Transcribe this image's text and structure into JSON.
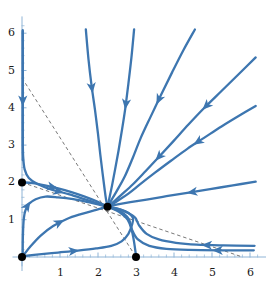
{
  "figure": {
    "kind": "phase-portrait",
    "background_color": "#ffffff",
    "trajectory_color": "#3d76b0",
    "axis_color": "#8fb4d6",
    "nullcline_color": "#555555",
    "equilibrium_color": "#000000"
  },
  "axes": {
    "x_label": "",
    "y_label": "",
    "x_ticks": [
      "1",
      "2",
      "3",
      "4",
      "5",
      "6"
    ],
    "y_ticks": [
      "1",
      "2",
      "3",
      "4",
      "5",
      "6"
    ],
    "x_tick_values": [
      1,
      2,
      3,
      4,
      5,
      6
    ],
    "y_tick_values": [
      1,
      2,
      3,
      4,
      5,
      6
    ],
    "xlim": [
      -0.25,
      6.45
    ],
    "ylim": [
      -0.25,
      6.45
    ],
    "minor_ticks": true,
    "grid": false
  },
  "chart_data": {
    "type": "scatter",
    "title": "",
    "xlabel": "",
    "ylabel": "",
    "xlim": [
      -0.25,
      6.45
    ],
    "ylim": [
      -0.25,
      6.45
    ],
    "grid": false,
    "legend": "none",
    "equilibria": [
      {
        "name": "origin",
        "x": 0,
        "y": 0,
        "stability": "unstable-source"
      },
      {
        "name": "y-axis-fixed-point",
        "x": 0,
        "y": 2,
        "stability": "saddle"
      },
      {
        "name": "x-axis-fixed-point",
        "x": 3,
        "y": 0,
        "stability": "saddle"
      },
      {
        "name": "interior-stable-node",
        "x": 2.25,
        "y": 1.35,
        "stability": "stable-node"
      }
    ],
    "nullclines": [
      {
        "name": "steep-nullcline",
        "style": "dashed",
        "points": [
          [
            0,
            4.8
          ],
          [
            3,
            0
          ]
        ]
      },
      {
        "name": "shallow-nullcline",
        "style": "dashed",
        "points": [
          [
            0,
            2.0
          ],
          [
            5.8,
            0
          ]
        ]
      }
    ],
    "trajectories": [
      {
        "name": "traj-y-axis-down",
        "points": [
          [
            0.02,
            6.05
          ],
          [
            0.02,
            5.0
          ],
          [
            0.02,
            4.0
          ],
          [
            0.02,
            3.2
          ],
          [
            0.03,
            2.7
          ],
          [
            0.07,
            2.35
          ],
          [
            0.18,
            2.12
          ],
          [
            0.42,
            1.95
          ],
          [
            0.8,
            1.8
          ],
          [
            1.25,
            1.68
          ],
          [
            1.7,
            1.53
          ],
          [
            2.05,
            1.42
          ],
          [
            2.25,
            1.35
          ]
        ],
        "arrows": [
          {
            "t": 0.3,
            "dir": "down"
          },
          {
            "t": 0.78,
            "dir": "right"
          }
        ]
      },
      {
        "name": "traj-y-axis-up-from-origin",
        "points": [
          [
            0.02,
            0.02
          ],
          [
            0.02,
            0.35
          ],
          [
            0.03,
            0.75
          ],
          [
            0.05,
            1.05
          ],
          [
            0.09,
            1.25
          ],
          [
            0.18,
            1.42
          ],
          [
            0.36,
            1.55
          ],
          [
            0.62,
            1.62
          ],
          [
            0.95,
            1.6
          ],
          [
            1.35,
            1.55
          ],
          [
            1.75,
            1.47
          ],
          [
            2.05,
            1.4
          ],
          [
            2.25,
            1.35
          ]
        ],
        "arrows": [
          {
            "t": 0.38,
            "dir": "up"
          }
        ]
      },
      {
        "name": "traj-lower-from-origin",
        "points": [
          [
            0.02,
            0.02
          ],
          [
            0.22,
            0.28
          ],
          [
            0.5,
            0.58
          ],
          [
            0.82,
            0.83
          ],
          [
            1.18,
            1.02
          ],
          [
            1.55,
            1.15
          ],
          [
            1.9,
            1.25
          ],
          [
            2.1,
            1.31
          ],
          [
            2.25,
            1.35
          ]
        ],
        "arrows": [
          {
            "t": 0.5,
            "dir": "up-right"
          }
        ]
      },
      {
        "name": "traj-along-x-from-origin",
        "points": [
          [
            0.02,
            0.02
          ],
          [
            0.45,
            0.07
          ],
          [
            0.95,
            0.12
          ],
          [
            1.45,
            0.17
          ],
          [
            1.95,
            0.23
          ],
          [
            2.35,
            0.3
          ],
          [
            2.62,
            0.42
          ],
          [
            2.8,
            0.62
          ],
          [
            2.9,
            0.88
          ],
          [
            2.92,
            1.05
          ],
          [
            2.8,
            1.18
          ],
          [
            2.6,
            1.27
          ],
          [
            2.4,
            1.32
          ],
          [
            2.25,
            1.35
          ]
        ],
        "arrows": [
          {
            "t": 0.33,
            "dir": "right"
          }
        ]
      },
      {
        "name": "traj-from-x-axis-point",
        "points": [
          [
            3.0,
            0.03
          ],
          [
            2.95,
            0.4
          ],
          [
            2.88,
            0.75
          ],
          [
            2.78,
            1.0
          ],
          [
            2.62,
            1.16
          ],
          [
            2.46,
            1.26
          ],
          [
            2.33,
            1.32
          ],
          [
            2.25,
            1.35
          ]
        ],
        "arrows": []
      },
      {
        "name": "traj-right-horizontal",
        "points": [
          [
            6.1,
            0.18
          ],
          [
            5.2,
            0.18
          ],
          [
            4.4,
            0.19
          ],
          [
            3.8,
            0.22
          ],
          [
            3.35,
            0.3
          ],
          [
            3.05,
            0.47
          ],
          [
            2.9,
            0.72
          ],
          [
            2.82,
            1.0
          ],
          [
            2.68,
            1.16
          ],
          [
            2.5,
            1.26
          ],
          [
            2.34,
            1.32
          ],
          [
            2.25,
            1.35
          ]
        ],
        "arrows": [
          {
            "t": 0.22,
            "dir": "left"
          }
        ]
      },
      {
        "name": "traj-right-horizontal-outer",
        "points": [
          [
            6.12,
            0.3
          ],
          [
            5.3,
            0.31
          ],
          [
            4.6,
            0.33
          ],
          [
            4.05,
            0.38
          ],
          [
            3.6,
            0.47
          ],
          [
            3.28,
            0.62
          ],
          [
            3.08,
            0.85
          ],
          [
            2.98,
            1.05
          ],
          [
            2.8,
            1.18
          ],
          [
            2.58,
            1.27
          ],
          [
            2.38,
            1.33
          ],
          [
            2.25,
            1.35
          ]
        ],
        "arrows": [
          {
            "t": 0.3,
            "dir": "left"
          }
        ]
      },
      {
        "name": "traj-steep-upper",
        "points": [
          [
            1.68,
            6.1
          ],
          [
            1.75,
            5.3
          ],
          [
            1.83,
            4.6
          ],
          [
            1.92,
            3.95
          ],
          [
            2.0,
            3.3
          ],
          [
            2.06,
            2.75
          ],
          [
            2.12,
            2.25
          ],
          [
            2.17,
            1.85
          ],
          [
            2.21,
            1.55
          ],
          [
            2.25,
            1.35
          ]
        ],
        "arrows": [
          {
            "t": 0.33,
            "dir": "down"
          }
        ]
      },
      {
        "name": "traj-diag-steep",
        "points": [
          [
            2.95,
            6.1
          ],
          [
            2.88,
            5.35
          ],
          [
            2.8,
            4.65
          ],
          [
            2.72,
            4.0
          ],
          [
            2.63,
            3.4
          ],
          [
            2.54,
            2.85
          ],
          [
            2.45,
            2.35
          ],
          [
            2.37,
            1.92
          ],
          [
            2.3,
            1.58
          ],
          [
            2.25,
            1.35
          ]
        ],
        "arrows": [
          {
            "t": 0.42,
            "dir": "down"
          }
        ]
      },
      {
        "name": "traj-diag-45",
        "points": [
          [
            4.55,
            6.1
          ],
          [
            4.25,
            5.55
          ],
          [
            3.95,
            4.95
          ],
          [
            3.66,
            4.35
          ],
          [
            3.38,
            3.75
          ],
          [
            3.12,
            3.18
          ],
          [
            2.9,
            2.62
          ],
          [
            2.7,
            2.15
          ],
          [
            2.5,
            1.78
          ],
          [
            2.35,
            1.52
          ],
          [
            2.25,
            1.35
          ]
        ],
        "arrows": [
          {
            "t": 0.4,
            "dir": "down-left"
          }
        ]
      },
      {
        "name": "traj-diag-shallow",
        "points": [
          [
            6.15,
            5.35
          ],
          [
            5.7,
            4.9
          ],
          [
            5.25,
            4.45
          ],
          [
            4.8,
            4.0
          ],
          [
            4.38,
            3.55
          ],
          [
            3.98,
            3.1
          ],
          [
            3.6,
            2.68
          ],
          [
            3.25,
            2.3
          ],
          [
            2.92,
            1.95
          ],
          [
            2.62,
            1.67
          ],
          [
            2.4,
            1.47
          ],
          [
            2.25,
            1.35
          ]
        ],
        "arrows": [
          {
            "t": 0.33,
            "dir": "down-left"
          },
          {
            "t": 0.66,
            "dir": "down-left"
          }
        ]
      },
      {
        "name": "traj-diag-low",
        "points": [
          [
            6.15,
            4.05
          ],
          [
            5.7,
            3.78
          ],
          [
            5.25,
            3.5
          ],
          [
            4.8,
            3.2
          ],
          [
            4.35,
            2.9
          ],
          [
            3.92,
            2.58
          ],
          [
            3.5,
            2.26
          ],
          [
            3.12,
            1.96
          ],
          [
            2.8,
            1.7
          ],
          [
            2.52,
            1.51
          ],
          [
            2.34,
            1.4
          ],
          [
            2.25,
            1.35
          ]
        ],
        "arrows": [
          {
            "t": 0.38,
            "dir": "down-left"
          }
        ]
      },
      {
        "name": "traj-near-horizontal-right",
        "points": [
          [
            6.15,
            2.02
          ],
          [
            5.55,
            1.92
          ],
          [
            4.95,
            1.82
          ],
          [
            4.35,
            1.72
          ],
          [
            3.8,
            1.63
          ],
          [
            3.28,
            1.54
          ],
          [
            2.85,
            1.47
          ],
          [
            2.52,
            1.41
          ],
          [
            2.25,
            1.35
          ]
        ],
        "arrows": [
          {
            "t": 0.43,
            "dir": "left"
          }
        ]
      },
      {
        "name": "traj-from-y2-point",
        "points": [
          [
            0.03,
            2.0
          ],
          [
            0.28,
            1.98
          ],
          [
            0.6,
            1.92
          ],
          [
            0.95,
            1.84
          ],
          [
            1.3,
            1.74
          ],
          [
            1.65,
            1.62
          ],
          [
            1.95,
            1.5
          ],
          [
            2.13,
            1.41
          ],
          [
            2.25,
            1.35
          ]
        ],
        "arrows": [
          {
            "t": 0.34,
            "dir": "right"
          }
        ]
      },
      {
        "name": "traj-y-axis-upper-segment",
        "points": [
          [
            0.02,
            6.08
          ],
          [
            0.02,
            5.55
          ],
          [
            0.02,
            4.95
          ],
          [
            0.02,
            4.35
          ],
          [
            0.02,
            3.75
          ],
          [
            0.02,
            3.15
          ],
          [
            0.02,
            2.6
          ]
        ],
        "arrows": []
      }
    ]
  }
}
